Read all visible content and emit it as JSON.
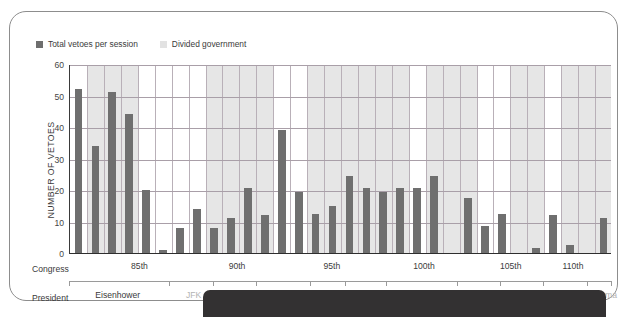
{
  "legend": {
    "series_dark_label": "Total vetoes per session",
    "series_light_label": "Divided government",
    "dark_color": "#6f6f6f",
    "light_color": "#e6e6e6"
  },
  "axes": {
    "y_title": "NUMBER OF VETOES",
    "y_ticks": [
      "0",
      "10",
      "20",
      "30",
      "40",
      "50",
      "60"
    ],
    "row_label_congress": "Congress",
    "row_label_president": "President"
  },
  "chart_data": {
    "type": "bar",
    "title": "",
    "xlabel": "",
    "ylabel": "NUMBER OF VETOES",
    "ylim": [
      0,
      60
    ],
    "yticks": [
      0,
      10,
      20,
      30,
      40,
      50,
      60
    ],
    "grid": true,
    "legend_position": "top-left",
    "series": [
      {
        "name": "Total vetoes per session",
        "color": "#6f6f6f",
        "values": [
          52,
          34,
          51,
          44,
          20,
          1,
          8,
          14,
          8,
          11,
          20.5,
          12,
          39,
          19.5,
          12.5,
          15,
          24.5,
          20.5,
          19.5,
          20.5,
          20.5,
          24.5,
          0,
          17.5,
          8.5,
          12.5,
          0,
          1.5,
          12,
          2.5,
          0,
          11
        ]
      }
    ],
    "categories": [
      "83rd",
      "84th",
      "85th",
      "86th",
      "87th",
      "88th",
      "89th",
      "90th",
      "91st",
      "92nd",
      "93rd",
      "94th",
      "95th",
      "96th",
      "97th",
      "98th",
      "99th",
      "100th",
      "101st",
      "102nd",
      "103rd",
      "104th",
      "105th",
      "106th",
      "107th",
      "108th",
      "109th",
      "110th",
      "111th",
      "112th",
      "113th",
      "114th"
    ],
    "divided_government": [
      false,
      true,
      true,
      true,
      false,
      false,
      false,
      false,
      true,
      true,
      true,
      true,
      false,
      false,
      true,
      true,
      true,
      true,
      true,
      true,
      false,
      true,
      true,
      true,
      false,
      false,
      true,
      true,
      false,
      true,
      true,
      true
    ],
    "congress_ticks": [
      {
        "label": "85th",
        "position_pct": 13.0
      },
      {
        "label": "90th",
        "position_pct": 31.0
      },
      {
        "label": "95th",
        "position_pct": 48.5
      },
      {
        "label": "100th",
        "position_pct": 65.5
      },
      {
        "label": "105th",
        "position_pct": 81.5
      },
      {
        "label": "110th",
        "position_pct": 93.0
      }
    ],
    "president_ticks": [
      {
        "label": "Eisenhower",
        "position_pct": 9.0,
        "divided": false
      },
      {
        "label": "JFK",
        "position_pct": 23.0,
        "divided": true
      },
      {
        "label": "Johnson",
        "position_pct": 30.0,
        "divided": true
      },
      {
        "label": "Nixon",
        "position_pct": 39.5,
        "divided": false
      },
      {
        "label": "Ford",
        "position_pct": 47.5,
        "divided": false
      },
      {
        "label": "Carter",
        "position_pct": 54.5,
        "divided": true
      },
      {
        "label": "Reagan",
        "position_pct": 65.0,
        "divided": false
      },
      {
        "label": "Bush",
        "position_pct": 75.0,
        "divided": false
      },
      {
        "label": "Clinton",
        "position_pct": 83.5,
        "divided": true
      },
      {
        "label": "Bush",
        "position_pct": 91.5,
        "divided": false
      },
      {
        "label": "Obama",
        "position_pct": 98.5,
        "divided": true
      }
    ]
  }
}
